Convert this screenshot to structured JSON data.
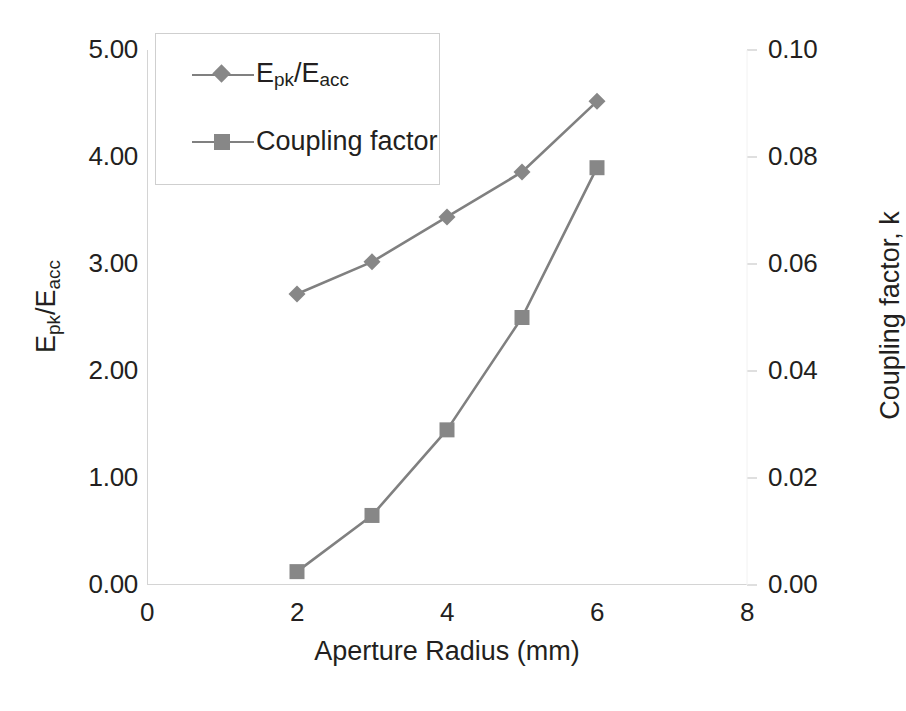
{
  "chart_data": {
    "type": "line",
    "title": "",
    "xlabel": "Aperture Radius (mm)",
    "ylabel": "Epk/Eacc",
    "ylabel_parts": {
      "pre": "E",
      "sub1": "pk",
      "mid": "/E",
      "sub2": "acc"
    },
    "y2label": "Coupling factor, k",
    "xlim": [
      0,
      8
    ],
    "ylim": [
      0,
      5
    ],
    "y2lim": [
      0,
      0.1
    ],
    "grid": false,
    "legend_position": "upper-left-inside",
    "x": [
      2,
      3,
      4,
      5,
      6
    ],
    "xticks": [
      "0",
      "2",
      "4",
      "6",
      "8"
    ],
    "xtick_values": [
      0,
      2,
      4,
      6,
      8
    ],
    "yticks": [
      "0.00",
      "1.00",
      "2.00",
      "3.00",
      "4.00",
      "5.00"
    ],
    "ytick_values": [
      0,
      1,
      2,
      3,
      4,
      5
    ],
    "y2ticks": [
      "0.00",
      "0.02",
      "0.04",
      "0.06",
      "0.08",
      "0.10"
    ],
    "y2tick_values": [
      0,
      0.02,
      0.04,
      0.06,
      0.08,
      0.1
    ],
    "series": [
      {
        "name": "Epk/Eacc",
        "legend_label_parts": {
          "pre": "E",
          "sub1": "pk",
          "mid": "/E",
          "sub2": "acc"
        },
        "axis": "left",
        "marker": "diamond",
        "color": "#808080",
        "marker_color": "#878787",
        "values": [
          2.72,
          3.02,
          3.44,
          3.86,
          4.52
        ]
      },
      {
        "name": "Coupling factor",
        "legend_label": "Coupling factor",
        "axis": "right",
        "marker": "square",
        "color": "#808080",
        "marker_color": "#878787",
        "values": [
          0.0025,
          0.013,
          0.029,
          0.05,
          0.078
        ]
      }
    ]
  },
  "legend": {
    "items": [
      {
        "key": "diamond-marker-icon"
      },
      {
        "key": "square-marker-icon",
        "label": "Coupling factor"
      }
    ]
  },
  "colors": {
    "line": "#808080",
    "marker": "#878787",
    "axis": "#d4d4d4",
    "text": "#231f20",
    "background": "#ffffff"
  }
}
